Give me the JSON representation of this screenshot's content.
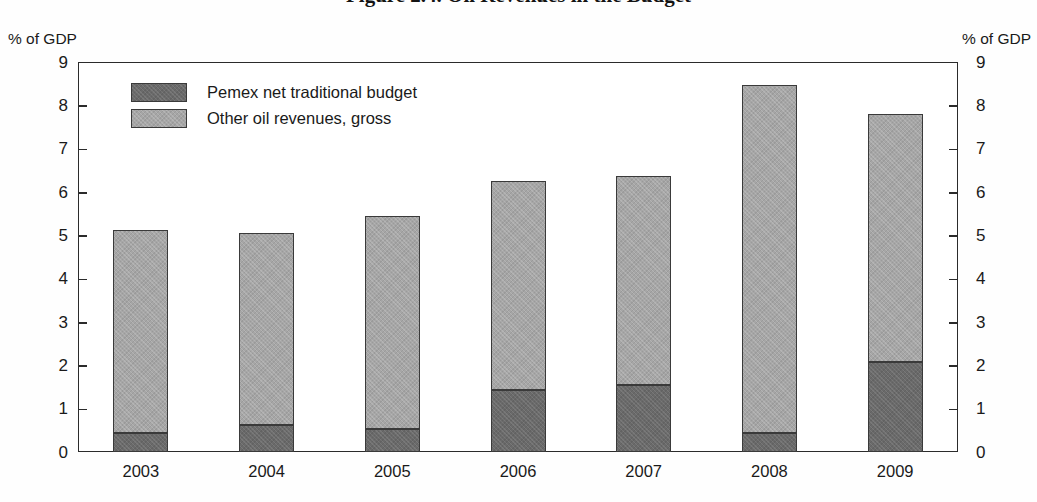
{
  "figure": {
    "title": "Figure 2.4. Oil Revenues in the Budget",
    "title_note": "cropped-at-top"
  },
  "axis": {
    "left_caption": "% of GDP",
    "right_caption": "% of GDP"
  },
  "legend": {
    "items": [
      {
        "label": "Pemex net traditional budget",
        "color": "#6a6a6a",
        "key": "pemex"
      },
      {
        "label": "Other oil revenues, gross",
        "color": "#a6a6a6",
        "key": "other"
      }
    ]
  },
  "chart_data": {
    "type": "bar",
    "title": "Figure 2.4. Oil Revenues in the Budget",
    "xlabel": "",
    "ylabel": "% of GDP",
    "ylim": [
      0,
      9
    ],
    "yticks": [
      0,
      1,
      2,
      3,
      4,
      5,
      6,
      7,
      8,
      9
    ],
    "ytick_labels": [
      "0",
      "1",
      "2",
      "3",
      "4",
      "5",
      "6",
      "7",
      "8",
      "9"
    ],
    "grid": false,
    "stacked": true,
    "legend_position": "upper-left-inside",
    "dual_axis": true,
    "categories": [
      "2003",
      "2004",
      "2005",
      "2006",
      "2007",
      "2008",
      "2009"
    ],
    "series": [
      {
        "name": "Pemex net traditional budget",
        "color": "#6a6a6a",
        "values": [
          0.43,
          0.62,
          0.53,
          1.43,
          1.55,
          0.44,
          2.07
        ]
      },
      {
        "name": "Other oil revenues, gross",
        "color": "#a6a6a6",
        "values": [
          4.69,
          4.43,
          4.92,
          4.82,
          4.82,
          8.03,
          5.73
        ]
      }
    ],
    "totals": [
      5.12,
      5.05,
      5.45,
      6.25,
      6.37,
      8.47,
      7.8
    ]
  }
}
